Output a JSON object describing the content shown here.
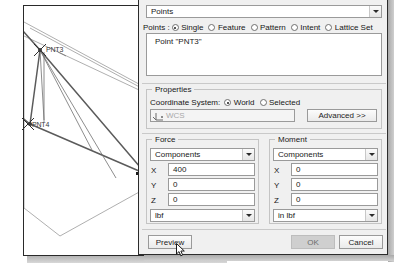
{
  "viewport": {
    "name": "cad-viewport",
    "points": [
      {
        "id": "pnt3",
        "label": "PNT3",
        "x": 40,
        "y": 50
      },
      {
        "id": "pnt4",
        "label": "PNT4",
        "x": 28,
        "y": 125
      },
      {
        "id": "pnt5",
        "label": "PNT5",
        "x": 146,
        "y": 174
      }
    ]
  },
  "dialog": {
    "type_combo": {
      "value": "Points",
      "name": "feature-type-combo"
    },
    "points_row": {
      "prefix": "Points :",
      "options": [
        {
          "label": "Single",
          "selected": true
        },
        {
          "label": "Feature",
          "selected": false
        },
        {
          "label": "Pattern",
          "selected": false
        },
        {
          "label": "Intent",
          "selected": false
        },
        {
          "label": "Lattice Set",
          "selected": false
        }
      ]
    },
    "points_list": {
      "items": [
        "Point \"PNT3\""
      ]
    },
    "properties": {
      "title": "Properties",
      "coord_label": "Coordinate System:",
      "coord_options": [
        {
          "label": "World",
          "selected": true
        },
        {
          "label": "Selected",
          "selected": false
        }
      ],
      "csys_field_value": "WCS",
      "advanced_button": "Advanced >>"
    },
    "force": {
      "title": "Force",
      "mode": "Components",
      "rows": [
        {
          "axis": "X",
          "value": "400"
        },
        {
          "axis": "Y",
          "value": "0"
        },
        {
          "axis": "Z",
          "value": "0"
        }
      ],
      "units": "lbf"
    },
    "moment": {
      "title": "Moment",
      "mode": "Components",
      "rows": [
        {
          "axis": "X",
          "value": "0"
        },
        {
          "axis": "Y",
          "value": "0"
        },
        {
          "axis": "Z",
          "value": "0"
        }
      ],
      "units": "in lbf"
    },
    "footer": {
      "preview": "Preview",
      "ok": "OK",
      "cancel": "Cancel"
    }
  },
  "colors": {
    "dialog_bg": "#f0f0f0",
    "field_bg": "#ffffff",
    "border": "#9a9a9a",
    "disabled_btn": "#cfcfcf"
  }
}
